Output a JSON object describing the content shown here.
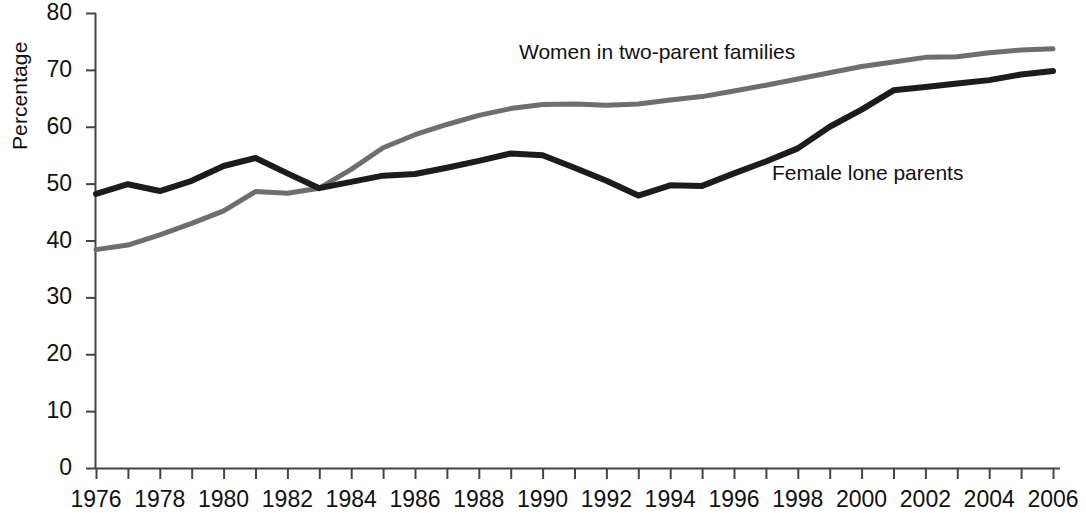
{
  "chart_data": {
    "type": "line",
    "title": "",
    "xlabel": "",
    "ylabel": "Percentage",
    "xlim": [
      1976,
      2006
    ],
    "ylim": [
      0,
      80
    ],
    "ytick_labels": [
      "0",
      "10",
      "20",
      "30",
      "40",
      "50",
      "60",
      "70",
      "80"
    ],
    "ytick_values": [
      0,
      10,
      20,
      30,
      40,
      50,
      60,
      70,
      80
    ],
    "xtick_labels": [
      "1976",
      "1978",
      "1980",
      "1982",
      "1984",
      "1986",
      "1988",
      "1990",
      "1992",
      "1994",
      "1996",
      "1998",
      "2000",
      "2002",
      "2004",
      "2006"
    ],
    "xtick_values": [
      1976,
      1978,
      1980,
      1982,
      1984,
      1986,
      1988,
      1990,
      1992,
      1994,
      1996,
      1998,
      2000,
      2002,
      2004,
      2006
    ],
    "minor_xticks_every": 1,
    "grid": false,
    "legend_position": "inline-annotations",
    "x": [
      1976,
      1977,
      1978,
      1979,
      1980,
      1981,
      1982,
      1983,
      1984,
      1985,
      1986,
      1987,
      1988,
      1989,
      1990,
      1991,
      1992,
      1993,
      1994,
      1995,
      1996,
      1997,
      1998,
      1999,
      2000,
      2001,
      2002,
      2003,
      2004,
      2005,
      2006
    ],
    "series": [
      {
        "name": "Women in two-parent families",
        "color": "#6e6e6e",
        "values": [
          38.4,
          39.2,
          41.0,
          43.0,
          45.2,
          48.6,
          48.3,
          49.2,
          52.5,
          56.3,
          58.6,
          60.4,
          62.0,
          63.2,
          63.9,
          64.0,
          63.8,
          64.0,
          64.7,
          65.3,
          66.3,
          67.3,
          68.4,
          69.5,
          70.6,
          71.4,
          72.2,
          72.3,
          73.0,
          73.5,
          73.7
        ]
      },
      {
        "name": "Female lone parents",
        "color": "#1c1c1c",
        "values": [
          48.2,
          49.9,
          48.7,
          50.5,
          53.1,
          54.5,
          51.8,
          49.2,
          50.3,
          51.4,
          51.7,
          52.8,
          54.0,
          55.3,
          55.0,
          52.8,
          50.5,
          47.9,
          49.7,
          49.6,
          51.8,
          53.9,
          56.2,
          60.0,
          63.0,
          66.4,
          67.0,
          67.6,
          68.2,
          69.2,
          69.8
        ]
      }
    ],
    "annotations": [
      {
        "text": "Women in two-parent families",
        "series": "Women in two-parent families"
      },
      {
        "text": "Female lone parents",
        "series": "Female lone parents"
      }
    ]
  },
  "axis": {
    "ylabel": "Percentage"
  }
}
